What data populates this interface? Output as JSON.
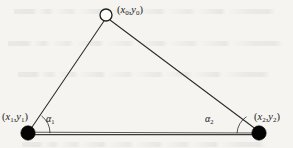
{
  "figure": {
    "name": "triangle-vertex-angle-diagram",
    "width": 293,
    "height": 148,
    "background_color": "#f6f4f0",
    "stroke_color": "#2b2b2b",
    "fill_color": "#000000"
  },
  "vertices": {
    "apex": {
      "id": "vertex-0",
      "marker": "open-circle",
      "x": 106,
      "y": 15,
      "radius": 6,
      "label_prefix": "(",
      "label_x": "x",
      "label_x_sub": "0",
      "label_comma": ",",
      "label_y": "y",
      "label_y_sub": "0",
      "label_suffix": ")",
      "label_text": "(x0,y0)"
    },
    "left": {
      "id": "vertex-1",
      "marker": "filled-circle",
      "x": 28,
      "y": 133,
      "radius": 7,
      "label_prefix": "(",
      "label_x": "x",
      "label_x_sub": "1",
      "label_comma": ",",
      "label_y": "y",
      "label_y_sub": "1",
      "label_suffix": ")",
      "label_text": "(x1,y1)"
    },
    "right": {
      "id": "vertex-2",
      "marker": "filled-circle",
      "x": 259,
      "y": 133,
      "radius": 7,
      "label_prefix": "(",
      "label_x": "x",
      "label_x_sub": "2",
      "label_comma": ",",
      "label_y": "y",
      "label_y_sub": "2",
      "label_suffix": ")",
      "label_text": "(x2,y2)"
    }
  },
  "angles": {
    "alpha1": {
      "id": "angle-alpha-1",
      "symbol": "α",
      "subscript": "1",
      "at_vertex": "left",
      "label_text": "α1"
    },
    "alpha2": {
      "id": "angle-alpha-2",
      "symbol": "α",
      "subscript": "2",
      "at_vertex": "right",
      "label_text": "α2"
    }
  },
  "edges": [
    {
      "id": "edge-left-leg",
      "from": "left",
      "to": "apex",
      "style": "thin"
    },
    {
      "id": "edge-right-leg",
      "from": "apex",
      "to": "right",
      "style": "thin"
    },
    {
      "id": "edge-base",
      "from": "left",
      "to": "right",
      "style": "thick"
    }
  ]
}
